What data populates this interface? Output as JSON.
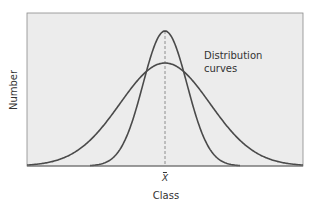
{
  "chart_data": {
    "type": "line",
    "title": "",
    "xlabel": "Class",
    "ylabel": "Number",
    "x_tick_labels": [
      "X̄"
    ],
    "annotation": "Distribution curves",
    "mean_marker": {
      "label": "X̄",
      "style": "dashed vertical line"
    },
    "grid": false,
    "legend": null,
    "series": [
      {
        "name": "Wide distribution curve",
        "shape": "gaussian",
        "mean": 0,
        "relative_peak": 0.76,
        "relative_sigma": 2.0
      },
      {
        "name": "Narrow distribution curve",
        "shape": "gaussian",
        "mean": 0,
        "relative_peak": 1.0,
        "relative_sigma": 1.0
      }
    ]
  },
  "plot": {
    "left": 27,
    "top": 13,
    "right": 303,
    "bottom": 166,
    "center_x": 165,
    "background": "#ececec",
    "curve_color": "#4a4a4a",
    "axis_color": "#8a8a8a",
    "curves": [
      {
        "peak_y": 63,
        "sigma_px": 45
      },
      {
        "peak_y": 31,
        "sigma_px": 22
      }
    ]
  },
  "labels": {
    "ylabel": "Number",
    "xlabel": "Class",
    "mean": "X",
    "annotation_line1": "Distribution",
    "annotation_line2": "curves"
  }
}
